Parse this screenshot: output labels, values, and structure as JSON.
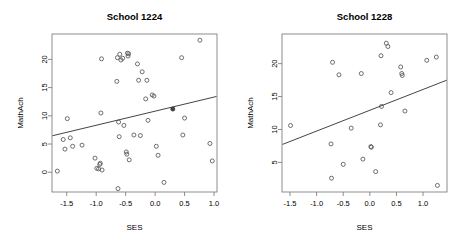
{
  "figure": {
    "width": 460,
    "height": 250,
    "background": "#ffffff",
    "panel_count": 2
  },
  "chart_data": [
    {
      "type": "scatter",
      "title": "School 1224",
      "xlabel": "SES",
      "ylabel": "MathAch",
      "xlim": [
        -1.75,
        1.05
      ],
      "ylim": [
        -3.5,
        24.5
      ],
      "xticks": [
        -1.5,
        -1.0,
        -0.5,
        0.0,
        0.5,
        1.0
      ],
      "xticklabels": [
        "-1.5",
        "-1.0",
        "-0.5",
        "0.0",
        "0.5",
        "1.0"
      ],
      "yticks": [
        0,
        5,
        10,
        15,
        20
      ],
      "yticklabels": [
        "0",
        "5",
        "10",
        "15",
        "20"
      ],
      "grid": false,
      "legend": "none",
      "marker": "open-circle",
      "fit_line": {
        "type": "linear",
        "intercept": 10.8,
        "slope": 2.5,
        "x_start": -1.75,
        "x_end": 1.05,
        "y_start": 6.45,
        "y_end": 13.45
      },
      "mean_point": {
        "x": 0.3,
        "y": 11.2,
        "style": "filled"
      },
      "points": [
        {
          "x": -1.66,
          "y": 0.2
        },
        {
          "x": -1.56,
          "y": 5.8
        },
        {
          "x": -1.53,
          "y": 4.1
        },
        {
          "x": -1.49,
          "y": 9.5
        },
        {
          "x": -1.44,
          "y": 6.1
        },
        {
          "x": -1.4,
          "y": 4.6
        },
        {
          "x": -1.24,
          "y": 4.8
        },
        {
          "x": -1.02,
          "y": 2.5
        },
        {
          "x": -0.99,
          "y": 0.7
        },
        {
          "x": -0.96,
          "y": 0.6
        },
        {
          "x": -0.94,
          "y": 1.4
        },
        {
          "x": -0.93,
          "y": 1.6
        },
        {
          "x": -0.92,
          "y": 10.5
        },
        {
          "x": -0.91,
          "y": 20.1
        },
        {
          "x": -0.9,
          "y": 0.4
        },
        {
          "x": -0.65,
          "y": 16.1
        },
        {
          "x": -0.64,
          "y": 20.3
        },
        {
          "x": -0.63,
          "y": -2.9
        },
        {
          "x": -0.62,
          "y": 8.9
        },
        {
          "x": -0.61,
          "y": 6.3
        },
        {
          "x": -0.6,
          "y": 20.9
        },
        {
          "x": -0.58,
          "y": 19.9
        },
        {
          "x": -0.55,
          "y": 20.2
        },
        {
          "x": -0.53,
          "y": 8.3
        },
        {
          "x": -0.49,
          "y": 3.6
        },
        {
          "x": -0.48,
          "y": 3.2
        },
        {
          "x": -0.47,
          "y": 21.1
        },
        {
          "x": -0.46,
          "y": 20.6
        },
        {
          "x": -0.45,
          "y": 21.0
        },
        {
          "x": -0.44,
          "y": 2.2
        },
        {
          "x": -0.36,
          "y": 6.6
        },
        {
          "x": -0.3,
          "y": 19.2
        },
        {
          "x": -0.28,
          "y": 16.3
        },
        {
          "x": -0.25,
          "y": 6.5
        },
        {
          "x": -0.22,
          "y": 17.8
        },
        {
          "x": -0.16,
          "y": 13.0
        },
        {
          "x": -0.14,
          "y": 16.3
        },
        {
          "x": -0.12,
          "y": 9.2
        },
        {
          "x": -0.05,
          "y": 13.7
        },
        {
          "x": -0.02,
          "y": 13.5
        },
        {
          "x": 0.02,
          "y": 4.6
        },
        {
          "x": 0.05,
          "y": 3.0
        },
        {
          "x": 0.15,
          "y": -1.8
        },
        {
          "x": 0.45,
          "y": 20.3
        },
        {
          "x": 0.47,
          "y": 6.6
        },
        {
          "x": 0.5,
          "y": 9.6
        },
        {
          "x": 0.76,
          "y": 23.4
        },
        {
          "x": 0.93,
          "y": 5.1
        },
        {
          "x": 0.97,
          "y": 2.0
        }
      ]
    },
    {
      "type": "scatter",
      "title": "School 1228",
      "xlabel": "SES",
      "ylabel": "MathAch",
      "xlim": [
        -1.65,
        1.45
      ],
      "ylim": [
        0.5,
        24.5
      ],
      "xticks": [
        -1.5,
        -1.0,
        -0.5,
        0.0,
        0.5,
        1.0
      ],
      "xticklabels": [
        "-1.5",
        "-1.0",
        "-0.5",
        "0.0",
        "0.5",
        "1.0"
      ],
      "yticks": [
        5,
        10,
        15,
        20
      ],
      "yticklabels": [
        "5",
        "10",
        "15",
        "20"
      ],
      "grid": false,
      "legend": "none",
      "marker": "open-circle",
      "fit_line": {
        "type": "linear",
        "intercept": 12.9,
        "slope": 3.15,
        "x_start": -1.65,
        "x_end": 1.45,
        "y_start": 7.7,
        "y_end": 17.5
      },
      "points": [
        {
          "x": -1.49,
          "y": 10.6
        },
        {
          "x": -0.73,
          "y": 7.8
        },
        {
          "x": -0.72,
          "y": 2.6
        },
        {
          "x": -0.7,
          "y": 20.2
        },
        {
          "x": -0.58,
          "y": 18.3
        },
        {
          "x": -0.5,
          "y": 4.7
        },
        {
          "x": -0.35,
          "y": 10.2
        },
        {
          "x": -0.16,
          "y": 18.5
        },
        {
          "x": -0.13,
          "y": 5.5
        },
        {
          "x": 0.02,
          "y": 7.4
        },
        {
          "x": 0.03,
          "y": 7.3
        },
        {
          "x": 0.11,
          "y": 3.6
        },
        {
          "x": 0.2,
          "y": 10.7
        },
        {
          "x": 0.21,
          "y": 21.2
        },
        {
          "x": 0.22,
          "y": 13.5
        },
        {
          "x": 0.31,
          "y": 23.1
        },
        {
          "x": 0.34,
          "y": 22.6
        },
        {
          "x": 0.4,
          "y": 15.6
        },
        {
          "x": 0.58,
          "y": 19.5
        },
        {
          "x": 0.6,
          "y": 18.5
        },
        {
          "x": 0.61,
          "y": 18.2
        },
        {
          "x": 0.66,
          "y": 12.8
        },
        {
          "x": 1.07,
          "y": 20.5
        },
        {
          "x": 1.25,
          "y": 21.0
        },
        {
          "x": 1.27,
          "y": 1.5
        }
      ]
    }
  ],
  "style": {
    "axis_color": "#808080",
    "point_color": "#555555",
    "line_color": "#444444",
    "text_color": "#000000"
  }
}
